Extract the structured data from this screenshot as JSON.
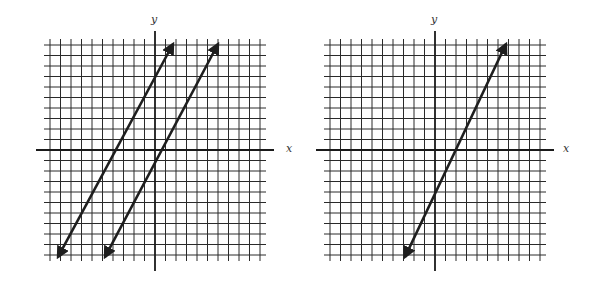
{
  "colors": {
    "grid": "#2a2a2a",
    "axis": "#1a1a1a",
    "line": "#1e1e1e",
    "label": "#333333",
    "background": "#ffffff"
  },
  "graphs": [
    {
      "id": "left",
      "x_label": "x",
      "y_label": "y",
      "origin_px": [
        155,
        150
      ],
      "unit_px": 10.5,
      "range": [
        -10,
        10
      ],
      "lines": [
        {
          "from_px": [
            58,
            257
          ],
          "to_px": [
            173,
            44
          ],
          "equation": "y = 2x + 8 (approx.)"
        },
        {
          "from_px": [
            105,
            257
          ],
          "to_px": [
            218,
            44
          ],
          "equation": "y = 2x - 2 (approx.)"
        }
      ]
    },
    {
      "id": "right",
      "x_label": "x",
      "y_label": "y",
      "origin_px": [
        435,
        150
      ],
      "unit_px": 10.5,
      "range": [
        -10,
        10
      ],
      "lines": [
        {
          "from_px": [
            405,
            257
          ],
          "to_px": [
            506,
            44
          ],
          "equation": "y = 2x - 4"
        }
      ]
    }
  ],
  "chart_data": [
    {
      "type": "line",
      "title": "",
      "xlabel": "x",
      "ylabel": "y",
      "xlim": [
        -10,
        10
      ],
      "ylim": [
        -10,
        10
      ],
      "grid": true,
      "series": [
        {
          "name": "line 1",
          "x": [
            -9,
            1
          ],
          "y": [
            -10,
            10
          ],
          "slope": 2,
          "intercept": 8
        },
        {
          "name": "line 2",
          "x": [
            -4,
            6
          ],
          "y": [
            -10,
            10
          ],
          "slope": 2,
          "intercept": -2
        }
      ]
    },
    {
      "type": "line",
      "title": "",
      "xlabel": "x",
      "ylabel": "y",
      "xlim": [
        -10,
        10
      ],
      "ylim": [
        -10,
        10
      ],
      "grid": true,
      "series": [
        {
          "name": "line",
          "x": [
            -3,
            7
          ],
          "y": [
            -10,
            10
          ],
          "slope": 2,
          "intercept": -4
        }
      ]
    }
  ]
}
